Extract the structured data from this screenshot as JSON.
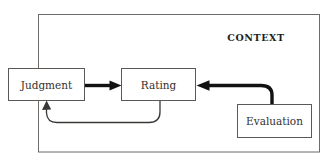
{
  "diagram": {
    "container": {
      "label": "CONTEXT",
      "name": "context-boundary",
      "border_color": "#6e6b68"
    },
    "nodes": [
      {
        "id": "judgment",
        "label": "Judgment",
        "x": 8,
        "y": 68,
        "width": 77,
        "height": 33
      },
      {
        "id": "rating",
        "label": "Rating",
        "x": 121,
        "y": 68,
        "width": 75,
        "height": 33
      },
      {
        "id": "evaluation",
        "label": "Evaluation",
        "x": 237,
        "y": 104,
        "width": 75,
        "height": 34
      }
    ],
    "edges": [
      {
        "id": "judgment-to-rating",
        "from": "judgment",
        "to": "rating",
        "style": "thick-straight",
        "label": ""
      },
      {
        "id": "evaluation-to-rating",
        "from": "evaluation",
        "to": "rating",
        "style": "thick-curved",
        "label": ""
      },
      {
        "id": "rating-to-judgment",
        "from": "rating",
        "to": "judgment",
        "style": "thin-curved-feedback",
        "label": ""
      }
    ],
    "colors": {
      "background": "#ffffff",
      "box_stroke": "#5b5855",
      "text": "#33312f",
      "thick_arrow": "#121212",
      "thin_arrow": "#3a3836"
    }
  }
}
